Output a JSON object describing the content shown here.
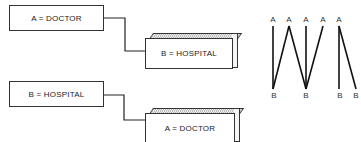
{
  "panel_top": {
    "box_left": {
      "label": "A = DOCTOR"
    },
    "box_right": {
      "label": "B = HOSPITAL"
    }
  },
  "panel_bottom": {
    "box_left": {
      "label": "B = HOSPITAL"
    },
    "box_right": {
      "label": "A = DOCTOR"
    }
  },
  "graph": {
    "top_nodes": [
      "A",
      "A",
      "A",
      "A",
      "A"
    ],
    "bottom_nodes": [
      "B",
      "B",
      "B",
      "B"
    ]
  }
}
